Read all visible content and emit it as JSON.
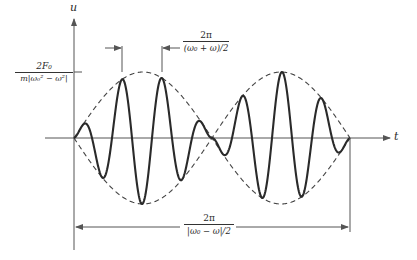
{
  "figure": {
    "type": "beat-phenomenon-plot",
    "axes": {
      "y_label": "u",
      "x_label": "t"
    },
    "labels": {
      "amplitude": {
        "numerator": "2F₀",
        "denominator": "m|ω₀² − ω²|"
      },
      "fast_period": {
        "numerator": "2π",
        "denominator": "(ω₀ + ω)/2"
      },
      "beat_period": {
        "numerator": "2π",
        "denominator": "|ω₀ − ω|/2"
      }
    },
    "colors": {
      "curve": "#2a2a2a",
      "envelope": "#444444",
      "axis": "#555555",
      "background": "#ffffff"
    }
  }
}
